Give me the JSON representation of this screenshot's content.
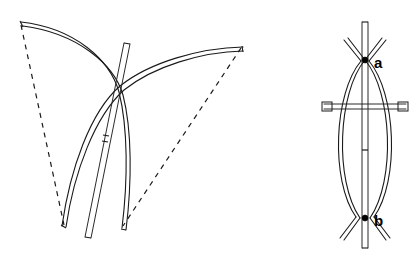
{
  "figure": {
    "background_color": "#ffffff",
    "line_color": "#1a1a1a",
    "label_color": "#000000"
  },
  "labels": {
    "top_node": "a",
    "bottom_node": "b"
  },
  "left_view": {
    "name": "perspective-view",
    "arc_first": {
      "name": "upper-left-arc",
      "start": [
        20,
        23
      ],
      "control": [
        95,
        40
      ],
      "end": [
        122,
        228
      ],
      "tip_cap": true
    },
    "arc_second": {
      "name": "upper-right-arc",
      "start": [
        243,
        46
      ],
      "control": [
        175,
        60
      ],
      "end": [
        63,
        227
      ],
      "tip_cap": true
    },
    "rod": {
      "name": "straight-rod",
      "start": [
        127,
        43
      ],
      "end": [
        88,
        238
      ],
      "tick_position": [
        107,
        140
      ]
    },
    "chord_dashed_left": {
      "name": "dashed-chord-left",
      "start": [
        20,
        23
      ],
      "end": [
        63,
        227
      ],
      "dash_pattern": "5,5"
    },
    "chord_dashed_right": {
      "name": "dashed-chord-right",
      "start": [
        243,
        46
      ],
      "end": [
        122,
        228
      ],
      "dash_pattern": "5,5"
    },
    "crossing_upper": [
      116,
      80
    ],
    "crossing_lower": [
      95,
      196
    ]
  },
  "right_view": {
    "name": "edge-on-view",
    "axis_rod": {
      "name": "vertical-axis-rod",
      "top": [
        365,
        22
      ],
      "bottom": [
        365,
        248
      ],
      "tick_position": [
        365,
        150
      ]
    },
    "lens_left_arc": {
      "name": "lens-left-arc",
      "top": [
        365,
        60
      ],
      "bulge_x": 332,
      "bottom": [
        365,
        218
      ]
    },
    "lens_right_arc": {
      "name": "lens-right-arc",
      "top": [
        365,
        60
      ],
      "bulge_x": 398,
      "bottom": [
        365,
        218
      ]
    },
    "crossbar": {
      "name": "horizontal-crossbar",
      "left": [
        322,
        106
      ],
      "right": [
        408,
        106
      ],
      "has_end_caps": true
    },
    "node_top": [
      365,
      60
    ],
    "node_bottom": [
      365,
      218
    ],
    "tail_spread_px": 22
  }
}
